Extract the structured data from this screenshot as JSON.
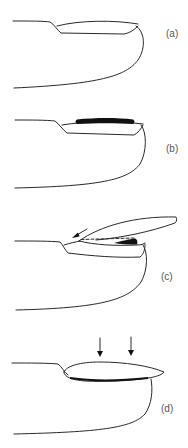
{
  "figure": {
    "panels": [
      {
        "id": "a",
        "label": "(a)",
        "feature": "normal nail plate on finger"
      },
      {
        "id": "b",
        "label": "(b)",
        "feature": "thick black band on nail plate"
      },
      {
        "id": "c",
        "label": "(c)",
        "feature": "nail plate lifted with dashed line, black wedge and arrow pointing to proximal fold"
      },
      {
        "id": "d",
        "label": "(d)",
        "feature": "lens-shaped nail plate with two downward arrows"
      }
    ]
  },
  "colors": {
    "line": "#2a2a2a",
    "fill_black": "#111111",
    "label": "#555555",
    "background": "#ffffff"
  }
}
